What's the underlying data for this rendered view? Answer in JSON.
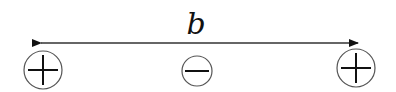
{
  "diagram": {
    "distance_label": "b",
    "charges": [
      {
        "sign": "+",
        "position": "left"
      },
      {
        "sign": "−",
        "position": "middle"
      },
      {
        "sign": "+",
        "position": "right"
      }
    ],
    "arrow": {
      "type": "double-headed",
      "spans": "left charge to right charge"
    },
    "colors": {
      "stroke": "#111111",
      "circle": "#555555",
      "background": "#ffffff"
    }
  }
}
